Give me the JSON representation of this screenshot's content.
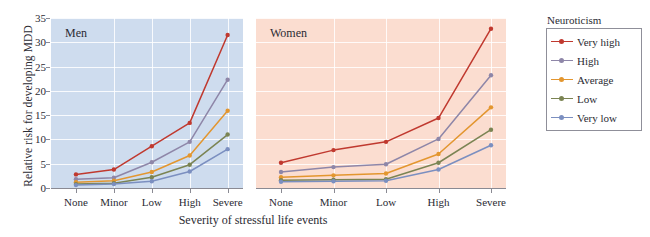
{
  "chart_data": {
    "type": "line",
    "title": "",
    "xlabel": "Severity of stressful life events",
    "ylabel": "Relative risk for developing MDD",
    "categories": [
      "None",
      "Minor",
      "Low",
      "High",
      "Severe"
    ],
    "ylim": [
      0,
      35
    ],
    "yticks": [
      0,
      5,
      10,
      15,
      20,
      25,
      30,
      35
    ],
    "grid": true,
    "legend_position": "right",
    "legend_title": "Neuroticism",
    "panels": [
      {
        "name": "Men",
        "background": "#cedcee",
        "series": [
          {
            "name": "Very high",
            "color": "#c0392f",
            "values": [
              2.8,
              3.8,
              8.6,
              13.4,
              31.5
            ]
          },
          {
            "name": "High",
            "color": "#8e86a8",
            "values": [
              1.8,
              2.1,
              5.3,
              9.5,
              22.3
            ]
          },
          {
            "name": "Average",
            "color": "#e3962f",
            "values": [
              1.2,
              1.5,
              3.3,
              6.7,
              15.9
            ]
          },
          {
            "name": "Low",
            "color": "#7b8453",
            "values": [
              0.8,
              1.0,
              2.2,
              4.8,
              11.0
            ]
          },
          {
            "name": "Very low",
            "color": "#7b8fc0",
            "values": [
              0.6,
              0.8,
              1.4,
              3.4,
              8.0
            ]
          }
        ]
      },
      {
        "name": "Women",
        "background": "#fbddd0",
        "series": [
          {
            "name": "Very high",
            "color": "#c0392f",
            "values": [
              5.2,
              7.8,
              9.5,
              14.4,
              32.8
            ]
          },
          {
            "name": "High",
            "color": "#8e86a8",
            "values": [
              3.3,
              4.3,
              4.9,
              10.1,
              23.2
            ]
          },
          {
            "name": "Average",
            "color": "#e3962f",
            "values": [
              2.2,
              2.6,
              3.0,
              7.0,
              16.6
            ]
          },
          {
            "name": "Low",
            "color": "#7b8453",
            "values": [
              1.6,
              1.7,
              1.8,
              5.2,
              12.0
            ]
          },
          {
            "name": "Very low",
            "color": "#7b8fc0",
            "values": [
              1.3,
              1.4,
              1.5,
              3.8,
              8.8
            ]
          }
        ]
      }
    ],
    "legend_entries": [
      {
        "label": "Very high",
        "color": "#c0392f"
      },
      {
        "label": "High",
        "color": "#8e86a8"
      },
      {
        "label": "Average",
        "color": "#e3962f"
      },
      {
        "label": "Low",
        "color": "#7b8453"
      },
      {
        "label": "Very low",
        "color": "#7b8fc0"
      }
    ]
  }
}
